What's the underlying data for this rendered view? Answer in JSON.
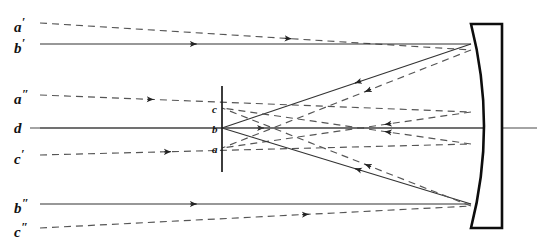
{
  "figure": {
    "background": "#ffffff",
    "ink": "#111111",
    "ray_solid_color": "#333333",
    "ray_dashed_color": "#555555",
    "width": 537,
    "height": 247
  },
  "labels": {
    "incoming_rays": [
      {
        "id": "a-prime",
        "base": "a",
        "prime": "′",
        "x": 14,
        "y": 16,
        "ray_y": 23
      },
      {
        "id": "b-prime",
        "base": "b",
        "prime": "′",
        "x": 14,
        "y": 37,
        "ray_y": 44
      },
      {
        "id": "a-dprime",
        "base": "a",
        "prime": "″",
        "x": 14,
        "y": 88,
        "ray_y": 95
      },
      {
        "id": "d",
        "base": "d",
        "prime": "",
        "x": 14,
        "y": 121,
        "ray_y": 128
      },
      {
        "id": "c-prime",
        "base": "c",
        "prime": "′",
        "x": 14,
        "y": 148,
        "ray_y": 155
      },
      {
        "id": "b-dprime",
        "base": "b",
        "prime": "″",
        "x": 14,
        "y": 197,
        "ray_y": 204
      },
      {
        "id": "c-dprime",
        "base": "c",
        "prime": "″",
        "x": 14,
        "y": 221,
        "ray_y": 228
      }
    ],
    "object_points": [
      {
        "id": "point-c",
        "text": "c",
        "x": 212,
        "y": 104,
        "plane_y": 108
      },
      {
        "id": "point-b",
        "text": "b",
        "x": 212,
        "y": 124,
        "plane_y": 128
      },
      {
        "id": "point-a",
        "text": "a",
        "x": 212,
        "y": 144,
        "plane_y": 148
      }
    ]
  },
  "geometry": {
    "object_plane": {
      "x": 222,
      "y_top": 86,
      "y_bottom": 172
    },
    "optical_axis": {
      "y": 128,
      "x_start": 30,
      "x_end": 537
    },
    "mirror": {
      "vertex_x": 485,
      "back_x": 502,
      "edge_x": 471,
      "y_top": 24,
      "y_bottom": 228,
      "type": "concave"
    },
    "mirror_top_hit": {
      "x": 471,
      "y": 50
    },
    "mirror_bottom_hit": {
      "x": 471,
      "y": 206
    },
    "focus_dashed": {
      "x": 390,
      "y": 128
    },
    "focus_solid": {
      "x": 297,
      "y": 128
    }
  },
  "ray_paths": {
    "incoming": [
      {
        "name": "a-prime-in",
        "dashed": true,
        "x1": 40,
        "y1": 23,
        "x2": 471,
        "y2": 50,
        "arrow_t": 0.58
      },
      {
        "name": "b-prime-in",
        "dashed": false,
        "x1": 40,
        "y1": 44,
        "x2": 471,
        "y2": 44,
        "arrow_t": 0.36
      },
      {
        "name": "a-dprime-in",
        "dashed": true,
        "x1": 40,
        "y1": 95,
        "x2": 471,
        "y2": 112,
        "arrow_t": 0.26
      },
      {
        "name": "d-in",
        "dashed": false,
        "x1": 40,
        "y1": 128,
        "x2": 485,
        "y2": 128,
        "arrow_t": 0.5
      },
      {
        "name": "c-prime-in",
        "dashed": true,
        "x1": 40,
        "y1": 155,
        "x2": 471,
        "y2": 144,
        "arrow_t": 0.3
      },
      {
        "name": "b-dprime-in",
        "dashed": false,
        "x1": 40,
        "y1": 204,
        "x2": 471,
        "y2": 204,
        "arrow_t": 0.36
      },
      {
        "name": "c-dprime-in",
        "dashed": true,
        "x1": 40,
        "y1": 228,
        "x2": 471,
        "y2": 206,
        "arrow_t": 0.62
      }
    ],
    "reflected": [
      {
        "name": "a-prime-refl",
        "dashed": true,
        "x1": 471,
        "y1": 50,
        "x2": 222,
        "y2": 148,
        "arrow_t": 0.42
      },
      {
        "name": "b-prime-refl",
        "dashed": false,
        "x1": 471,
        "y1": 44,
        "x2": 222,
        "y2": 128,
        "arrow_t": 0.46
      },
      {
        "name": "a-dprime-refl",
        "dashed": true,
        "x1": 471,
        "y1": 112,
        "x2": 222,
        "y2": 148,
        "arrow_t": 0.34
      },
      {
        "name": "c-prime-refl",
        "dashed": true,
        "x1": 471,
        "y1": 144,
        "x2": 222,
        "y2": 108,
        "arrow_t": 0.34
      },
      {
        "name": "b-dprime-refl",
        "dashed": false,
        "x1": 471,
        "y1": 204,
        "x2": 222,
        "y2": 128,
        "arrow_t": 0.46
      },
      {
        "name": "c-dprime-refl",
        "dashed": true,
        "x1": 471,
        "y1": 206,
        "x2": 222,
        "y2": 108,
        "arrow_t": 0.42
      }
    ]
  }
}
